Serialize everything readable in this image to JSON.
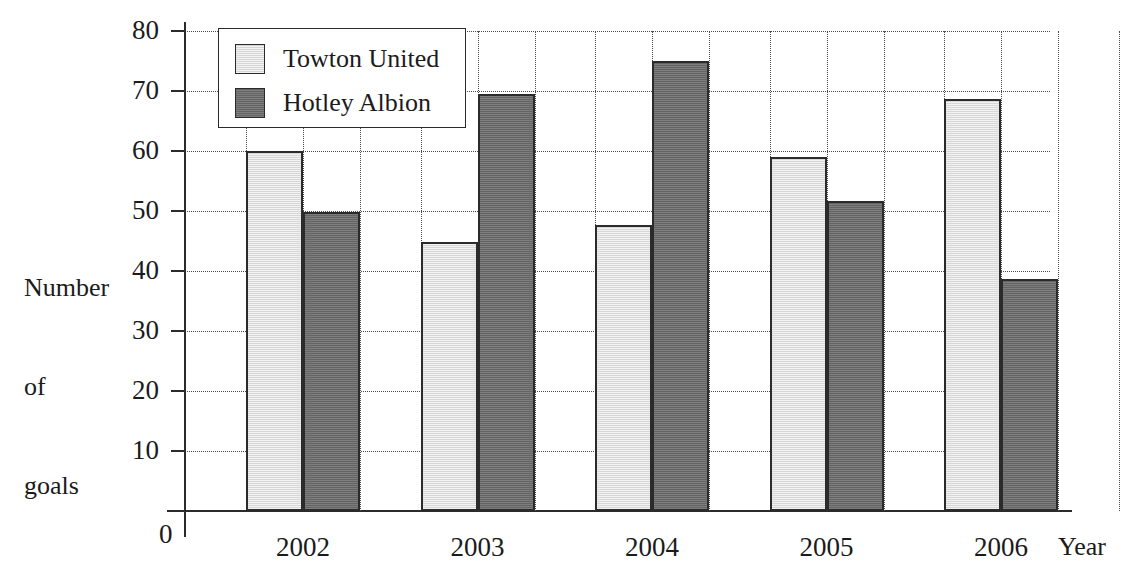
{
  "chart_data": {
    "type": "bar",
    "title": "",
    "xlabel": "Year",
    "ylabel": "Number\nof\ngoals",
    "ylabel_lines": [
      "Number",
      "of",
      "goals"
    ],
    "categories": [
      "2002",
      "2003",
      "2004",
      "2005",
      "2006"
    ],
    "ylim": [
      0,
      80
    ],
    "ytick_labels": [
      "0",
      "10",
      "20",
      "30",
      "40",
      "50",
      "60",
      "70",
      "80"
    ],
    "ytick_values": [
      0,
      10,
      20,
      30,
      40,
      50,
      60,
      70,
      80
    ],
    "grid": "dotted-both",
    "legend_position": "top-left-inside",
    "series": [
      {
        "name": "Towton United",
        "color": "#e2e2e2",
        "edge_color": "#2b2b2b",
        "values": [
          60,
          44.8,
          47.7,
          59,
          68.7
        ]
      },
      {
        "name": "Hotley Albion",
        "color": "#6f6f6f",
        "edge_color": "#2b2b2b",
        "values": [
          49.8,
          69.5,
          75,
          51.7,
          38.7
        ]
      }
    ]
  },
  "axis": {
    "zero_label": "0",
    "x_axis_name": "Year"
  }
}
